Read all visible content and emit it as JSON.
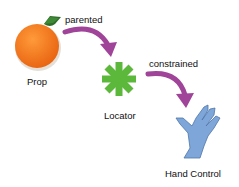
{
  "nodes": {
    "prop": {
      "label": "Prop",
      "color": "#f07a1e"
    },
    "locator": {
      "label": "Locator",
      "color": "#5cb83a"
    },
    "hand_control": {
      "label": "Hand Control",
      "color": "#7ea6d8"
    }
  },
  "edges": [
    {
      "from": "prop",
      "to": "locator",
      "label": "parented",
      "color": "#a0449a"
    },
    {
      "from": "locator",
      "to": "hand_control",
      "label": "constrained",
      "color": "#a0449a"
    }
  ]
}
